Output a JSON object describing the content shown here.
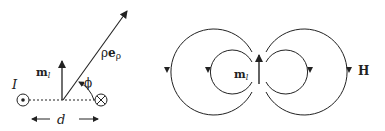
{
  "left_panel": {
    "current_label": "I",
    "moment_label_main": "m",
    "moment_label_sub": "l",
    "position_label_rho": "ρ",
    "position_label_e": "e",
    "position_label_sub": "ρ",
    "angle_label": "ϕ",
    "distance_label": "d",
    "current_out_symbol": "dot-in-circle",
    "current_in_symbol": "cross-in-circle"
  },
  "right_panel": {
    "moment_label_main": "m",
    "moment_label_sub": "l",
    "field_label": "H"
  },
  "colors": {
    "stroke": "#222222",
    "background": "#ffffff"
  }
}
